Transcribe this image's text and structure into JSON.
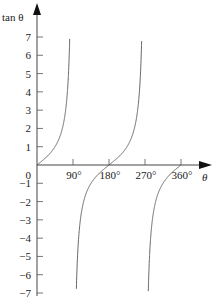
{
  "chart_data": {
    "type": "line",
    "title": "",
    "function": "tan θ",
    "xlabel": "θ",
    "ylabel": "tan θ",
    "xlim": [
      0,
      390
    ],
    "ylim": [
      -7,
      7
    ],
    "x_ticks": [
      {
        "value": 90,
        "label": "90°"
      },
      {
        "value": 180,
        "label": "180°"
      },
      {
        "value": 270,
        "label": "270°"
      },
      {
        "value": 360,
        "label": "360°"
      }
    ],
    "y_ticks": [
      {
        "value": 7,
        "label": "7"
      },
      {
        "value": 6,
        "label": "6"
      },
      {
        "value": 5,
        "label": "5"
      },
      {
        "value": 4,
        "label": "4"
      },
      {
        "value": 3,
        "label": "3"
      },
      {
        "value": 2,
        "label": "2"
      },
      {
        "value": 1,
        "label": "1"
      },
      {
        "value": 0,
        "label": "0"
      },
      {
        "value": -1,
        "label": "−1"
      },
      {
        "value": -2,
        "label": "−2"
      },
      {
        "value": -3,
        "label": "−3"
      },
      {
        "value": -4,
        "label": "−4"
      },
      {
        "value": -5,
        "label": "−5"
      },
      {
        "value": -6,
        "label": "−6"
      },
      {
        "value": -7,
        "label": "−7"
      }
    ],
    "series": [
      {
        "name": "tan θ branch 1",
        "domain": [
          0,
          90
        ]
      },
      {
        "name": "tan θ branch 2",
        "domain": [
          90,
          270
        ]
      },
      {
        "name": "tan θ branch 3",
        "domain": [
          270,
          360
        ]
      }
    ],
    "grid": false,
    "legend": null
  },
  "labels": {
    "y_axis": "tan θ",
    "x_axis": "θ",
    "origin": "0"
  }
}
